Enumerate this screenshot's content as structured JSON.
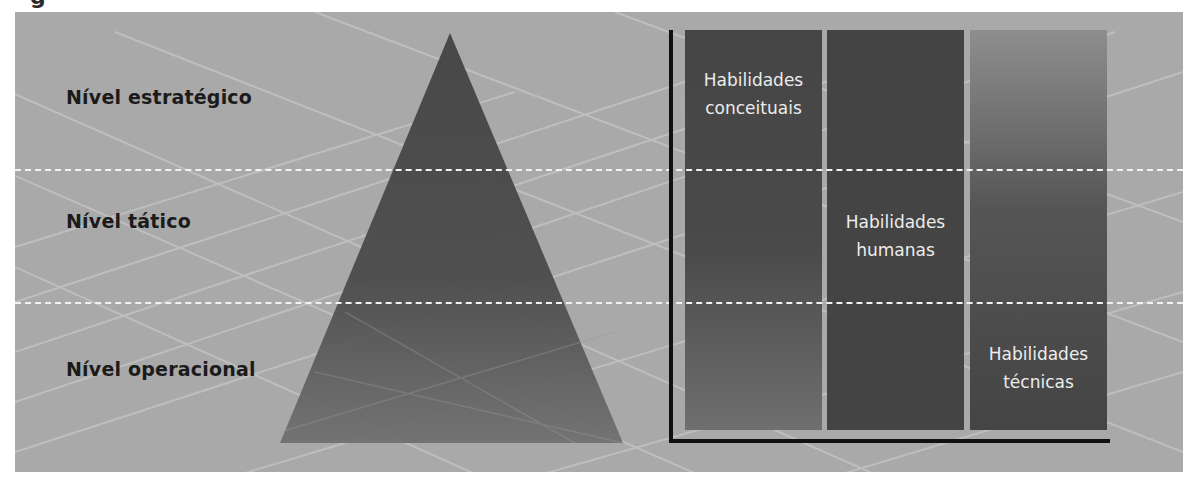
{
  "caption_fragment": "g",
  "levels": [
    {
      "label": "Nível estratégico"
    },
    {
      "label": "Nível tático"
    },
    {
      "label": "Nível operacional"
    }
  ],
  "skills": [
    {
      "line1": "Habilidades",
      "line2": "conceituais"
    },
    {
      "line1": "Habilidades",
      "line2": "humanas"
    },
    {
      "line1": "Habilidades",
      "line2": "técnicas"
    }
  ],
  "colors": {
    "panel_bg": "#a9a9a9",
    "pyramid_top": "#444444",
    "pyramid_bottom": "#707070",
    "column_dark": "#444444",
    "column_light": "#8e8e8e",
    "axis": "#111111",
    "divider": "#f2f2f2",
    "skill_text": "#ececec",
    "level_text": "#1b1b1b"
  }
}
